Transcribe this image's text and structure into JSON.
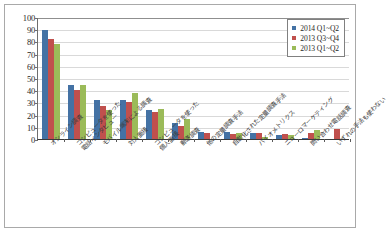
{
  "chart_data": {
    "type": "bar",
    "title": "",
    "xlabel": "",
    "ylabel": "",
    "ylim": [
      0,
      100
    ],
    "ytick_step": 10,
    "yticks": [
      100,
      90,
      80,
      70,
      60,
      50,
      40,
      30,
      20,
      10,
      0
    ],
    "grid": true,
    "legend_position": "top-right",
    "categories": [
      "オンライン調査",
      "コンピュータを使った電話インタビュー",
      "モバイル端末による調査",
      "対人面接",
      "コンピュータを使った個人面接",
      "郵送調査",
      "他の定量調査手法",
      "自動化された定量調査手法",
      "バイオメトリクス",
      "ニューロマーケティング",
      "問い合わせ電話調査",
      "いずれの手法も使わない"
    ],
    "categories_display": [
      {
        "line1": "オンライン調査",
        "line2": ""
      },
      {
        "line1": "コンピュータを使った",
        "line2": "電話インタビュー"
      },
      {
        "line1": "モバイル端末による調査",
        "line2": ""
      },
      {
        "line1": "対人面接",
        "line2": ""
      },
      {
        "line1": "コンピュータを使った",
        "line2": "個人面接"
      },
      {
        "line1": "郵送調査",
        "line2": ""
      },
      {
        "line1": "他の定量調査手法",
        "line2": ""
      },
      {
        "line1": "自動化された定量調査手法",
        "line2": ""
      },
      {
        "line1": "バイオメトリクス",
        "line2": ""
      },
      {
        "line1": "ニューロマーケティング",
        "line2": ""
      },
      {
        "line1": "問い合わせ電話調査",
        "line2": ""
      },
      {
        "line1": "いずれの手法も使わない",
        "line2": ""
      }
    ],
    "series": [
      {
        "name": "2014 Q1~Q2",
        "color": "#4472a4",
        "values": [
          89,
          44,
          32,
          32,
          24,
          13,
          6,
          6,
          5,
          3,
          1,
          0
        ]
      },
      {
        "name": "2013 Q3~Q4",
        "color": "#c0504d",
        "values": [
          82,
          40,
          27,
          30,
          22,
          11,
          5,
          4,
          5,
          4,
          5,
          8
        ]
      },
      {
        "name": "2013 Q1~Q2",
        "color": "#9bbb59",
        "values": [
          78,
          44,
          24,
          38,
          25,
          16,
          0,
          5,
          2,
          3,
          7,
          0
        ]
      }
    ]
  },
  "legend": {
    "entries": [
      {
        "label": "2014 Q1~Q2",
        "color": "#4472a4"
      },
      {
        "label": "2013 Q3~Q4",
        "color": "#c0504d"
      },
      {
        "label": "2013 Q1~Q2",
        "color": "#9bbb59"
      }
    ]
  }
}
